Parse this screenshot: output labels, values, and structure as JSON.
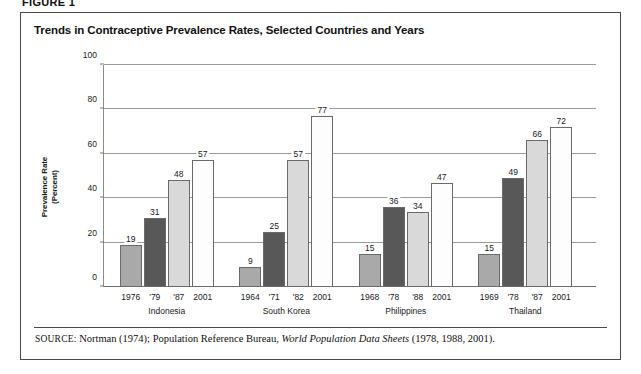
{
  "figure": {
    "caption": "FIGURE 1",
    "title": "Trends in Contraceptive Prevalence Rates, Selected Countries and Years"
  },
  "source": {
    "label": "SOURCE:",
    "text_before": " Nortman (1974); Population Reference Bureau, ",
    "italic": "World Population Data Sheets",
    "text_after": " (1978, 1988, 2001)."
  },
  "colors": {
    "series_1": "#a9a9a9",
    "series_2": "#585858",
    "series_3": "#d9d9d9",
    "series_4": "#fdfdfd",
    "gridline": "#9b9b9b",
    "border": "#4a4a4a"
  },
  "chart_data": {
    "type": "bar",
    "title": "Trends in Contraceptive Prevalence Rates, Selected Countries and Years",
    "xlabel": "",
    "ylabel": "Prevalence Rate\n(Percent)",
    "ylabel_line1": "Prevalence Rate",
    "ylabel_line2": "(Percent)",
    "ylim": [
      0,
      100
    ],
    "yticks": [
      0,
      20,
      40,
      60,
      80,
      100
    ],
    "grid": true,
    "legend": "none",
    "categories": [
      "Indonesia",
      "South Korea",
      "Philippines",
      "Thailand"
    ],
    "groups": [
      {
        "name": "Indonesia",
        "bars": [
          {
            "year": "1976",
            "value": 19
          },
          {
            "year": "'79",
            "value": 31
          },
          {
            "year": "'87",
            "value": 48
          },
          {
            "year": "2001",
            "value": 57
          }
        ]
      },
      {
        "name": "South Korea",
        "bars": [
          {
            "year": "1964",
            "value": 9
          },
          {
            "year": "'71",
            "value": 25
          },
          {
            "year": "'82",
            "value": 57
          },
          {
            "year": "2001",
            "value": 77
          }
        ]
      },
      {
        "name": "Philippines",
        "bars": [
          {
            "year": "1968",
            "value": 15
          },
          {
            "year": "'78",
            "value": 36
          },
          {
            "year": "'88",
            "value": 34
          },
          {
            "year": "2001",
            "value": 47
          }
        ]
      },
      {
        "name": "Thailand",
        "bars": [
          {
            "year": "1969",
            "value": 15
          },
          {
            "year": "'78",
            "value": 49
          },
          {
            "year": "'87",
            "value": 66
          },
          {
            "year": "2001",
            "value": 72
          }
        ]
      }
    ]
  }
}
